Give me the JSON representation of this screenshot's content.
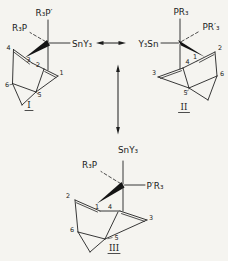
{
  "figure": {
    "colors": {
      "ink": "#1c1c1c",
      "background": "#f5f4f0"
    },
    "structures": {
      "I": {
        "name": "I",
        "ligand_top": "R₃P′",
        "ligand_left": "R₃P",
        "ligand_right": "SnY₃",
        "atoms": {
          "n1": "1",
          "n2": "2",
          "n3": "3",
          "n4": "4",
          "n5": "5",
          "n6": "6"
        }
      },
      "II": {
        "name": "II",
        "ligand_top": "PR₃",
        "ligand_right": "PR′₃",
        "ligand_left": "Y₃Sn",
        "atoms": {
          "n1": "1",
          "n2": "2",
          "n3": "3",
          "n4": "4",
          "n5": "5",
          "n6": "6"
        }
      },
      "III": {
        "name": "III",
        "ligand_top": "SnY₃",
        "ligand_left": "R₃P",
        "ligand_right": "P′R₃",
        "atoms": {
          "n1": "1",
          "n2": "2",
          "n3": "3",
          "n4": "4",
          "n5": "5",
          "n6": "6"
        }
      }
    }
  }
}
